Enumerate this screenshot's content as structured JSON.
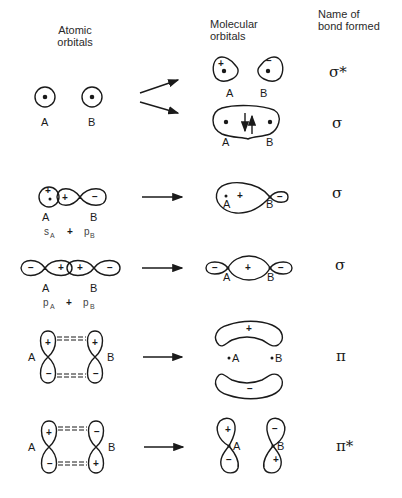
{
  "headers": {
    "atomic": [
      "Atomic",
      "orbitals"
    ],
    "molecular": [
      "Molecular",
      "orbitals"
    ],
    "bond": [
      "Name of",
      "bond formed"
    ]
  },
  "rows": [
    {
      "id": "s-s",
      "atomic": {
        "atom_a": "A",
        "atom_b": "B",
        "combination": ""
      },
      "molecular": [
        {
          "kind": "antibonding",
          "labels": [
            "A",
            "B"
          ],
          "signs": [
            "+",
            "−"
          ],
          "bond": "σ*"
        },
        {
          "kind": "bonding",
          "labels": [
            "A",
            "B"
          ],
          "electrons": "↓↑",
          "bond": "σ"
        }
      ]
    },
    {
      "id": "s-p",
      "atomic": {
        "atom_a": "A",
        "atom_b": "B",
        "signs": [
          "+",
          "+",
          "−"
        ],
        "combination": [
          "s",
          "A",
          "+",
          "p",
          "B"
        ]
      },
      "molecular": {
        "labels": [
          "A",
          "B"
        ],
        "signs": [
          "+",
          "−"
        ]
      },
      "bond": "σ"
    },
    {
      "id": "p-p-axial",
      "atomic": {
        "atom_a": "A",
        "atom_b": "B",
        "signs": [
          "−",
          "+",
          "+",
          "−"
        ],
        "combination": [
          "p",
          "A",
          "+",
          "p",
          "B"
        ]
      },
      "molecular": {
        "labels": [
          "A",
          "B"
        ],
        "signs": [
          "−",
          "+",
          "−"
        ]
      },
      "bond": "σ"
    },
    {
      "id": "p-p-pi",
      "atomic": {
        "atom_a": "A",
        "atom_b": "B",
        "signs": [
          "+",
          "−",
          "+",
          "−"
        ]
      },
      "molecular": {
        "labels": [
          "A",
          "B"
        ],
        "signs": [
          "+",
          "−"
        ]
      },
      "bond": "π"
    },
    {
      "id": "p-p-pi-star",
      "atomic": {
        "atom_a": "A",
        "atom_b": "B",
        "signs": [
          "+",
          "−",
          "−",
          "+"
        ]
      },
      "molecular": {
        "labels": [
          "A",
          "B"
        ],
        "signs": [
          "+",
          "−",
          "−",
          "+"
        ]
      },
      "bond": "π*"
    }
  ]
}
